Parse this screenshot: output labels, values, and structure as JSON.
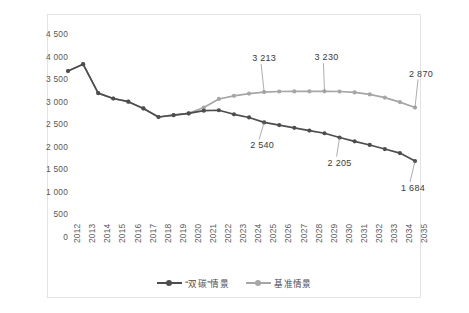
{
  "chart_data": {
    "type": "line",
    "title": "",
    "subtitle": "",
    "xlabel": "",
    "ylabel": "",
    "ylim": [
      0,
      4500
    ],
    "ytick_step": 500,
    "grid": false,
    "legend_position": "bottom-center",
    "categories": [
      "2012",
      "2013",
      "2014",
      "2015",
      "2016",
      "2017",
      "2018",
      "2019",
      "2020",
      "2021",
      "2022",
      "2023",
      "2024",
      "2025",
      "2026",
      "2027",
      "2028",
      "2029",
      "2030",
      "2031",
      "2032",
      "2033",
      "2034",
      "2035"
    ],
    "ytick_labels": [
      "4 500",
      "4 000",
      "3 500",
      "3 000",
      "2 500",
      "2 000",
      "1 500",
      "1 000",
      "500",
      "0"
    ],
    "ytick_values": [
      4500,
      4000,
      3500,
      3000,
      2500,
      2000,
      1500,
      1000,
      500,
      0
    ],
    "series": [
      {
        "name": "“双碳”情景",
        "color": "#4d4d4d",
        "values": [
          3680,
          3830,
          3190,
          3070,
          3000,
          2850,
          2660,
          2700,
          2740,
          2800,
          2810,
          2720,
          2650,
          2540,
          2480,
          2420,
          2360,
          2300,
          2205,
          2120,
          2040,
          1950,
          1860,
          1684
        ]
      },
      {
        "name": "基准情景",
        "color": "#a6a6a6",
        "values": [
          3680,
          3830,
          3190,
          3070,
          3000,
          2850,
          2660,
          2700,
          2740,
          2870,
          3060,
          3130,
          3180,
          3213,
          3225,
          3228,
          3230,
          3230,
          3225,
          3205,
          3160,
          3090,
          2990,
          2870
        ]
      }
    ],
    "annotations": [
      {
        "text": "3 213",
        "series": "基准情景",
        "category": "2025",
        "value": 3213
      },
      {
        "text": "3 230",
        "series": "基准情景",
        "category": "2029",
        "value": 3230
      },
      {
        "text": "2 870",
        "series": "基准情景",
        "category": "2035",
        "value": 2870
      },
      {
        "text": "2 540",
        "series": "“双碳”情景",
        "category": "2025",
        "value": 2540
      },
      {
        "text": "2 205",
        "series": "“双碳”情景",
        "category": "2030",
        "value": 2205
      },
      {
        "text": "1 684",
        "series": "“双碳”情景",
        "category": "2035",
        "value": 1684
      }
    ]
  },
  "legend": {
    "items": [
      {
        "label": "“双碳”情景",
        "color": "#4d4d4d"
      },
      {
        "label": "基准情景",
        "color": "#a6a6a6"
      }
    ]
  },
  "colors": {
    "dual_carbon": "#4d4d4d",
    "baseline": "#a6a6a6",
    "axis_text": "#595959",
    "border": "#e3e3e3",
    "background": "#ffffff"
  }
}
